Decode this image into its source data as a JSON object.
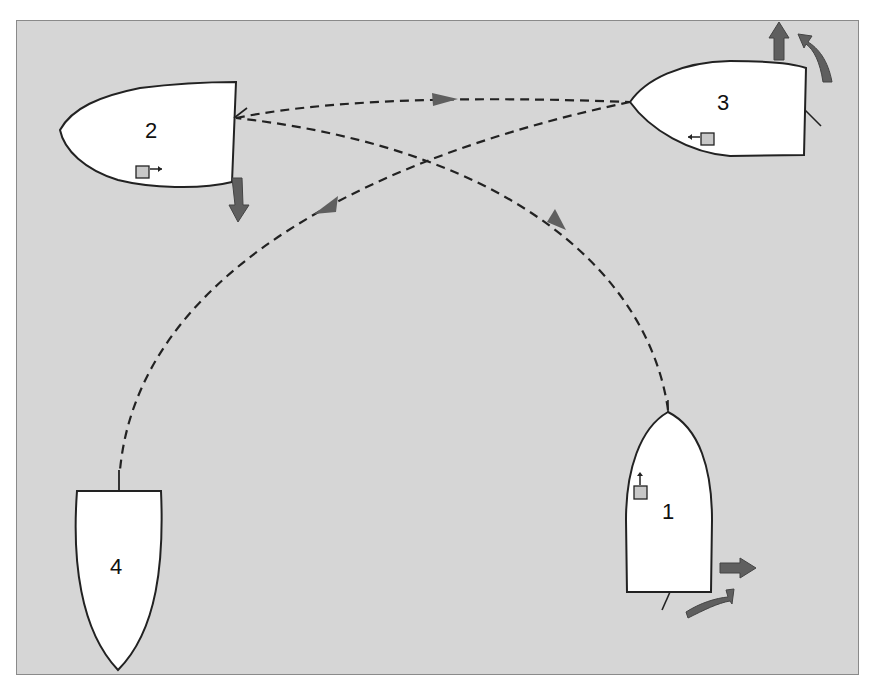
{
  "diagram": {
    "background": "#d6d6d6",
    "boat_fill": "#ffffff",
    "outline_color": "#222222",
    "arrow_color": "#5f5f5f",
    "boats": [
      {
        "id": "1",
        "label": "1",
        "orientation": "bow-up"
      },
      {
        "id": "2",
        "label": "2",
        "orientation": "bow-left"
      },
      {
        "id": "3",
        "label": "3",
        "orientation": "bow-left"
      },
      {
        "id": "4",
        "label": "4",
        "orientation": "bow-down"
      }
    ],
    "paths": [
      {
        "from": "1",
        "to": "2",
        "style": "dashed"
      },
      {
        "from": "2",
        "to": "3",
        "style": "dashed"
      },
      {
        "from": "3",
        "to": "4",
        "style": "dashed"
      }
    ]
  }
}
